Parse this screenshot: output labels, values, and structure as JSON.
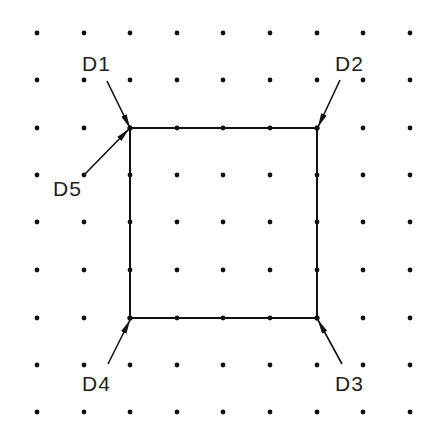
{
  "diagram": {
    "grid": {
      "xs": [
        37,
        84,
        130,
        177,
        223,
        270,
        317,
        363,
        410
      ],
      "ys": [
        33,
        80,
        128,
        175,
        222,
        270,
        318,
        365,
        412
      ],
      "dot_radius": 2.4,
      "dot_color": "#111111"
    },
    "square": {
      "corners": [
        [
          130,
          128
        ],
        [
          317,
          128
        ],
        [
          317,
          318
        ],
        [
          130,
          318
        ]
      ],
      "stroke": "#111111"
    },
    "leaders": [
      {
        "label": "D1",
        "text_x": 82,
        "text_y": 71,
        "from": [
          107,
          81
        ],
        "to": [
          130,
          128
        ]
      },
      {
        "label": "D2",
        "text_x": 335,
        "text_y": 71,
        "from": [
          340,
          80
        ],
        "to": [
          318,
          127
        ]
      },
      {
        "label": "D3",
        "text_x": 335,
        "text_y": 391,
        "from": [
          342,
          364
        ],
        "to": [
          318,
          320
        ]
      },
      {
        "label": "D4",
        "text_x": 82,
        "text_y": 391,
        "from": [
          108,
          364
        ],
        "to": [
          130,
          320
        ]
      },
      {
        "label": "D5",
        "text_x": 53,
        "text_y": 196,
        "from": [
          84,
          175
        ],
        "to": [
          129,
          129
        ]
      }
    ]
  }
}
